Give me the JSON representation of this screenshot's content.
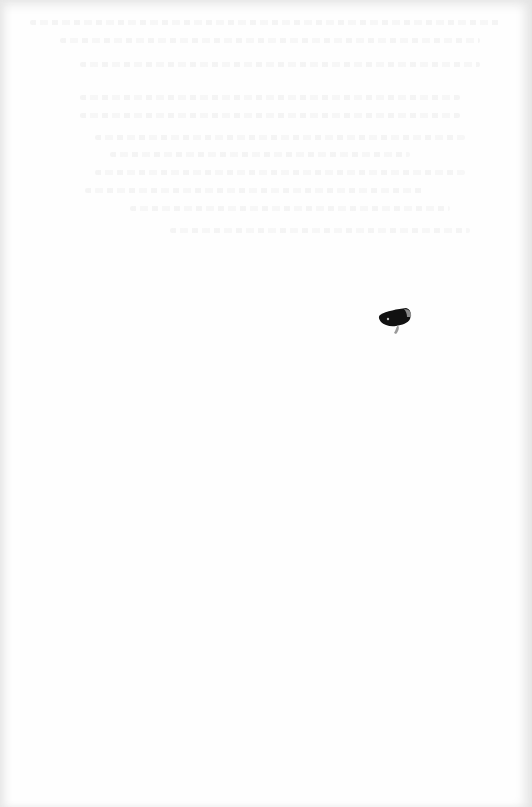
{
  "document": {
    "type": "scanned-page",
    "content_text": "",
    "note": "Blank page; only faint, illegible bleed-through text visible",
    "ghost_lines": [
      {
        "top": 20,
        "left": 30,
        "width": 470
      },
      {
        "top": 38,
        "left": 60,
        "width": 420
      },
      {
        "top": 62,
        "left": 80,
        "width": 400
      },
      {
        "top": 95,
        "left": 80,
        "width": 380
      },
      {
        "top": 113,
        "left": 80,
        "width": 380
      },
      {
        "top": 135,
        "left": 95,
        "width": 370
      },
      {
        "top": 152,
        "left": 110,
        "width": 300
      },
      {
        "top": 170,
        "left": 95,
        "width": 370
      },
      {
        "top": 188,
        "left": 85,
        "width": 340
      },
      {
        "top": 206,
        "left": 130,
        "width": 320
      },
      {
        "top": 228,
        "left": 170,
        "width": 300
      }
    ],
    "mark": {
      "label": "ink-blot",
      "color": "#111111"
    }
  }
}
